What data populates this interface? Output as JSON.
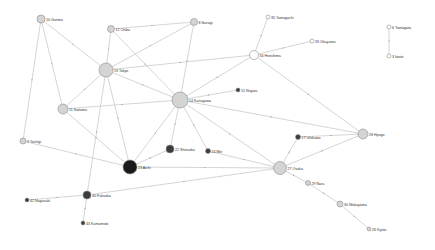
{
  "colors": {
    "light": "#d4d4d4",
    "white": "#ffffff",
    "dark": "#3c3c3c",
    "black": "#1a1a1a",
    "edge": "#b8b8b8"
  },
  "nodes": [
    {
      "id": "10",
      "label": "10 Gunma",
      "x": 41,
      "y": 19,
      "r": 4,
      "fill": "light"
    },
    {
      "id": "12",
      "label": "12 Chiba",
      "x": 111,
      "y": 29,
      "r": 3.5,
      "fill": "light"
    },
    {
      "id": "8",
      "label": "8 Ibaragi",
      "x": 194,
      "y": 22,
      "r": 3.5,
      "fill": "light"
    },
    {
      "id": "35",
      "label": "35 Yamaguchi",
      "x": 268,
      "y": 17,
      "r": 2,
      "fill": "white"
    },
    {
      "id": "33",
      "label": "33 Okayama",
      "x": 312,
      "y": 41,
      "r": 2,
      "fill": "white"
    },
    {
      "id": "34",
      "label": "34 Hiroshima",
      "x": 254,
      "y": 55,
      "r": 4.5,
      "fill": "white"
    },
    {
      "id": "6",
      "label": "6 Yamagata",
      "x": 389,
      "y": 27,
      "r": 2,
      "fill": "white"
    },
    {
      "id": "3",
      "label": "3 Iwate",
      "x": 389,
      "y": 56,
      "r": 2,
      "fill": "white"
    },
    {
      "id": "13",
      "label": "13 Tokyo",
      "x": 106,
      "y": 70,
      "r": 7,
      "fill": "light"
    },
    {
      "id": "14",
      "label": "14 Kanagawa",
      "x": 180,
      "y": 100,
      "r": 8,
      "fill": "light"
    },
    {
      "id": "15",
      "label": "15 Niigata",
      "x": 238,
      "y": 90,
      "r": 2,
      "fill": "dark"
    },
    {
      "id": "11",
      "label": "11 Saitama",
      "x": 63,
      "y": 109,
      "r": 5,
      "fill": "light"
    },
    {
      "id": "9",
      "label": "9 Tochigi",
      "x": 23,
      "y": 141,
      "r": 3,
      "fill": "light"
    },
    {
      "id": "28",
      "label": "28 Hyogo",
      "x": 363,
      "y": 134,
      "r": 5,
      "fill": "light"
    },
    {
      "id": "17",
      "label": "17 Ishikawa",
      "x": 298,
      "y": 137,
      "r": 2.5,
      "fill": "dark"
    },
    {
      "id": "22",
      "label": "22 Shizuoka",
      "x": 170,
      "y": 149,
      "r": 4,
      "fill": "dark"
    },
    {
      "id": "24",
      "label": "24 Mie",
      "x": 208,
      "y": 151,
      "r": 2.5,
      "fill": "dark"
    },
    {
      "id": "23",
      "label": "23 Aichi",
      "x": 130,
      "y": 167,
      "r": 7,
      "fill": "black"
    },
    {
      "id": "27",
      "label": "27 Osaka",
      "x": 280,
      "y": 168,
      "r": 6.5,
      "fill": "light"
    },
    {
      "id": "29",
      "label": "29 Nara",
      "x": 308,
      "y": 183,
      "r": 2.5,
      "fill": "light"
    },
    {
      "id": "30",
      "label": "30 Wakayama",
      "x": 340,
      "y": 204,
      "r": 3,
      "fill": "light"
    },
    {
      "id": "26",
      "label": "26 Kyoto",
      "x": 369,
      "y": 229,
      "r": 2,
      "fill": "light"
    },
    {
      "id": "40",
      "label": "40 Fukuoka",
      "x": 87,
      "y": 195,
      "r": 4,
      "fill": "dark"
    },
    {
      "id": "42",
      "label": "42 Nagasaki",
      "x": 27,
      "y": 200,
      "r": 2,
      "fill": "dark"
    },
    {
      "id": "43",
      "label": "43 Kumamoto",
      "x": 83,
      "y": 223,
      "r": 2,
      "fill": "dark"
    }
  ],
  "edges": [
    [
      "10",
      "13"
    ],
    [
      "10",
      "11"
    ],
    [
      "10",
      "9"
    ],
    [
      "12",
      "8"
    ],
    [
      "12",
      "13"
    ],
    [
      "12",
      "14"
    ],
    [
      "8",
      "13"
    ],
    [
      "8",
      "14"
    ],
    [
      "35",
      "34"
    ],
    [
      "33",
      "34"
    ],
    [
      "34",
      "13"
    ],
    [
      "34",
      "14"
    ],
    [
      "34",
      "28"
    ],
    [
      "6",
      "3"
    ],
    [
      "13",
      "11"
    ],
    [
      "13",
      "14"
    ],
    [
      "13",
      "23"
    ],
    [
      "13",
      "40"
    ],
    [
      "14",
      "15"
    ],
    [
      "14",
      "11"
    ],
    [
      "14",
      "22"
    ],
    [
      "14",
      "24"
    ],
    [
      "14",
      "23"
    ],
    [
      "14",
      "27"
    ],
    [
      "14",
      "28"
    ],
    [
      "11",
      "23"
    ],
    [
      "9",
      "23"
    ],
    [
      "28",
      "17"
    ],
    [
      "28",
      "27"
    ],
    [
      "17",
      "27"
    ],
    [
      "22",
      "23"
    ],
    [
      "24",
      "27"
    ],
    [
      "23",
      "27"
    ],
    [
      "27",
      "40"
    ],
    [
      "27",
      "29"
    ],
    [
      "29",
      "30"
    ],
    [
      "30",
      "26"
    ],
    [
      "40",
      "42"
    ],
    [
      "40",
      "43"
    ]
  ]
}
